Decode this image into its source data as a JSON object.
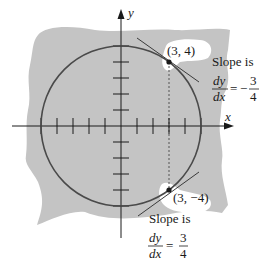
{
  "diagram": {
    "colors": {
      "background": "#ffffff",
      "shaded_region": "#c4c4c4",
      "curve": "#4a4a4a",
      "axes": "#1a1a1a",
      "label_halo": "#ffffff"
    },
    "axes": {
      "x_label": "x",
      "y_label": "y",
      "ticks_per_side": 5,
      "unit_px": 16
    },
    "circle": {
      "radius_units": 5
    },
    "points": [
      {
        "label": "(3, 4)",
        "x": 3,
        "y": 4,
        "slope_caption": "Slope is",
        "slope_numerator_lhs": "dy",
        "slope_denominator_lhs": "dx",
        "slope_equals": "=",
        "slope_sign": "−",
        "slope_numerator": "3",
        "slope_denominator": "4"
      },
      {
        "label": "(3, −4)",
        "x": 3,
        "y": -4,
        "slope_caption": "Slope is",
        "slope_numerator_lhs": "dy",
        "slope_denominator_lhs": "dx",
        "slope_equals": "=",
        "slope_sign": "",
        "slope_numerator": "3",
        "slope_denominator": "4"
      }
    ]
  }
}
